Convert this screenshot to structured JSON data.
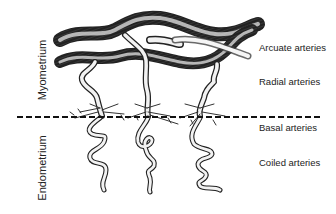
{
  "diagram": {
    "regions": [
      {
        "id": "myometrium",
        "label": "Myometrium"
      },
      {
        "id": "endometrium",
        "label": "Endometrium"
      }
    ],
    "labels": [
      {
        "id": "arcuate",
        "text": "Arcuate arteries"
      },
      {
        "id": "radial",
        "text": "Radial arteries"
      },
      {
        "id": "basal",
        "text": "Basal arteries"
      },
      {
        "id": "coiled",
        "text": "Coiled arteries"
      }
    ],
    "boundary": {
      "style": "dashed",
      "color": "#111111"
    },
    "colors": {
      "ink": "#222222",
      "vessel_fill": "#f2f2f2",
      "background": "#ffffff"
    }
  }
}
